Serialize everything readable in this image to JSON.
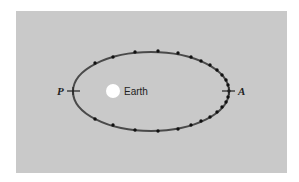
{
  "diagram": {
    "labels": {
      "perigee": "P",
      "apogee": "A",
      "central_body": "Earth"
    },
    "colors": {
      "background": "#c9c9c9",
      "orbit": "#4a4a4a",
      "dots": "#111111",
      "earth": "#ffffff"
    },
    "orbit": {
      "center": [
        151,
        91.5
      ],
      "semi_major": 78,
      "semi_minor": 39.5
    },
    "earth": {
      "center": [
        113,
        91
      ],
      "radius": 7
    },
    "position_markers": [
      [
        95,
        63
      ],
      [
        113,
        57
      ],
      [
        135,
        52
      ],
      [
        158,
        51
      ],
      [
        178,
        53
      ],
      [
        191,
        57
      ],
      [
        201,
        61
      ],
      [
        210,
        65
      ],
      [
        217,
        70
      ],
      [
        222,
        75
      ],
      [
        226,
        80
      ],
      [
        228,
        85
      ],
      [
        229,
        91
      ],
      [
        228,
        97
      ],
      [
        226,
        102
      ],
      [
        222,
        107
      ],
      [
        217,
        112
      ],
      [
        210,
        117
      ],
      [
        201,
        121
      ],
      [
        191,
        125
      ],
      [
        178,
        129
      ],
      [
        158,
        131
      ],
      [
        135,
        130
      ],
      [
        113,
        125
      ],
      [
        95,
        119
      ]
    ]
  }
}
